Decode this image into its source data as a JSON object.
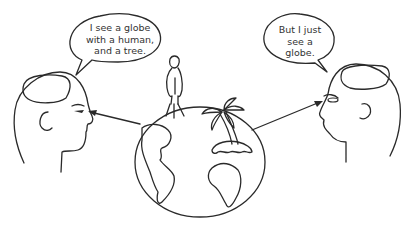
{
  "diagram": {
    "left_speech_bubble": {
      "lines": [
        "I see a globe",
        "with a human,",
        "and a tree."
      ]
    },
    "right_speech_bubble": {
      "lines": [
        "But I just",
        "see a",
        "globe."
      ]
    },
    "elements": [
      "left-head",
      "right-head",
      "globe",
      "human-figure",
      "palm-tree",
      "arrow-to-left-eye",
      "arrow-to-right-eye"
    ],
    "colors": {
      "line": "#2a2a2a",
      "text": "#333333",
      "background": "#ffffff"
    }
  }
}
